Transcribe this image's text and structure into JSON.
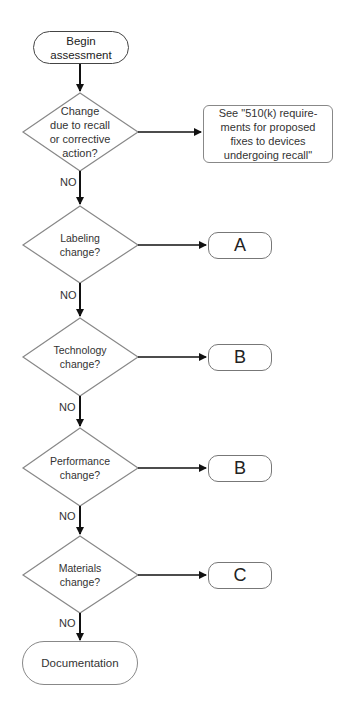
{
  "start": {
    "label": "Begin assessment",
    "line1": "Begin",
    "line2": "assessment"
  },
  "decisions": [
    {
      "line1": "Change",
      "line2": "due to recall",
      "line3": "or corrective",
      "line4": "action?"
    },
    {
      "line1": "Labeling",
      "line2": "change?"
    },
    {
      "line1": "Technology",
      "line2": "change?"
    },
    {
      "line1": "Performance",
      "line2": "change?"
    },
    {
      "line1": "Materials",
      "line2": "change?"
    }
  ],
  "see_box": {
    "line1": "See \"510(k) require-",
    "line2": "ments for proposed",
    "line3": "fixes to devices",
    "line4": "undergoing recall\""
  },
  "outcomes": [
    "A",
    "B",
    "B",
    "C"
  ],
  "no_label": "NO",
  "end": {
    "label": "Documentation"
  },
  "colors": {
    "stroke": "#444444",
    "diamond_stroke": "#888888",
    "text": "#222222"
  }
}
